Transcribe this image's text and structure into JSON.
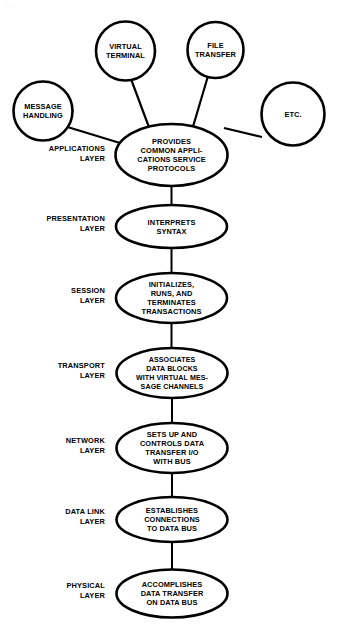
{
  "diagram": {
    "artifact_text": "...",
    "colors": {
      "background": "#ffffff",
      "stroke": "#000000",
      "text": "#000000",
      "fill": "#ffffff"
    },
    "application_services": [
      {
        "id": "virtual-terminal",
        "shape": "circle",
        "lines": [
          "VIRTUAL",
          "TERMINAL"
        ],
        "cx": 125.5,
        "cy": 51,
        "r": 29.5
      },
      {
        "id": "file-transfer",
        "shape": "circle",
        "lines": [
          "FILE",
          "TRANSFER"
        ],
        "cx": 215.5,
        "cy": 50,
        "r": 28
      },
      {
        "id": "message-handling",
        "shape": "circle",
        "lines": [
          "MESSAGE",
          "HANDLING"
        ],
        "cx": 43,
        "cy": 111,
        "r": 29.5
      },
      {
        "id": "etc",
        "shape": "circle",
        "lines": [
          "ETC."
        ],
        "cx": 293,
        "cy": 114,
        "r": 31.5
      }
    ],
    "layers": [
      {
        "id": "applications",
        "label_lines": [
          "APPLICATIONS",
          "LAYER"
        ],
        "label_x": 105,
        "label_y": 153,
        "node_lines": [
          "PROVIDES",
          "COMMON APPLI-",
          "CATIONS SERVICE",
          "PROTOCOLS"
        ],
        "cx": 171.5,
        "cy": 155,
        "rx": 56,
        "ry": 31
      },
      {
        "id": "presentation",
        "label_lines": [
          "PRESENTATION",
          "LAYER"
        ],
        "label_x": 105,
        "label_y": 223,
        "node_lines": [
          "INTERPRETS",
          "SYNTAX"
        ],
        "cx": 171.5,
        "cy": 226.5,
        "rx": 55.5,
        "ry": 21.5
      },
      {
        "id": "session",
        "label_lines": [
          "SESSION",
          "LAYER"
        ],
        "label_x": 105,
        "label_y": 295,
        "node_lines": [
          "INITIALIZES,",
          "RUNS, AND",
          "TERMINATES",
          "TRANSACTIONS"
        ],
        "cx": 171.5,
        "cy": 298,
        "rx": 55.5,
        "ry": 25
      },
      {
        "id": "transport",
        "label_lines": [
          "TRANSPORT",
          "LAYER"
        ],
        "label_x": 105,
        "label_y": 370,
        "node_lines": [
          "ASSOCIATES",
          "DATA BLOCKS",
          "WITH VIRTUAL MES-",
          "SAGE CHANNELS"
        ],
        "cx": 172,
        "cy": 373,
        "rx": 55.5,
        "ry": 25
      },
      {
        "id": "network",
        "label_lines": [
          "NETWORK",
          "LAYER"
        ],
        "label_x": 105,
        "label_y": 445,
        "node_lines": [
          "SETS UP AND",
          "CONTROLS DATA",
          "TRANSFER I/O",
          "WITH BUS"
        ],
        "cx": 172,
        "cy": 448,
        "rx": 55.5,
        "ry": 25
      },
      {
        "id": "data-link",
        "label_lines": [
          "DATA LINK",
          "LAYER"
        ],
        "label_x": 105,
        "label_y": 516,
        "node_lines": [
          "ESTABLISHES",
          "CONNECTIONS",
          "TO DATA BUS"
        ],
        "cx": 172,
        "cy": 519.5,
        "rx": 55.5,
        "ry": 22.5
      },
      {
        "id": "physical",
        "label_lines": [
          "PHYSICAL",
          "LAYER"
        ],
        "label_x": 105,
        "label_y": 590,
        "node_lines": [
          "ACCOMPLISHES",
          "DATA TRANSFER",
          "ON DATA BUS"
        ],
        "cx": 172,
        "cy": 593.5,
        "rx": 55.5,
        "ry": 24
      }
    ],
    "spokes": [
      {
        "id": "spoke-virtual-terminal",
        "x1": 131,
        "y1": 79,
        "x2": 150,
        "y2": 130
      },
      {
        "id": "spoke-file-transfer",
        "x1": 208,
        "y1": 76,
        "x2": 192,
        "y2": 130
      },
      {
        "id": "spoke-message-handling",
        "x1": 67.5,
        "y1": 127,
        "x2": 120,
        "y2": 143
      },
      {
        "id": "spoke-etc",
        "x1": 262,
        "y1": 137,
        "x2": 224,
        "y2": 128
      }
    ],
    "stack_connectors": [
      {
        "id": "connector-applications-presentation",
        "x": 171.5,
        "y1": 186,
        "y2": 205
      },
      {
        "id": "connector-presentation-session",
        "x": 171.5,
        "y1": 248,
        "y2": 273
      },
      {
        "id": "connector-session-transport",
        "x": 171.5,
        "y1": 323,
        "y2": 348
      },
      {
        "id": "connector-transport-network",
        "x": 172,
        "y1": 398,
        "y2": 423
      },
      {
        "id": "connector-network-datalink",
        "x": 172,
        "y1": 473,
        "y2": 497
      },
      {
        "id": "connector-datalink-physical",
        "x": 172,
        "y1": 542,
        "y2": 569.5
      }
    ]
  }
}
